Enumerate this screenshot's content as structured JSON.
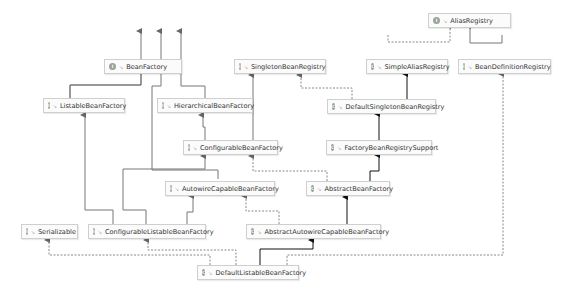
{
  "diagram": {
    "colors": {
      "background": "#ffffff",
      "node_border": "#cfcfcf",
      "node_fill": "#fbfbfb",
      "edge_extends": "#111111",
      "edge_interface_extends": "#777777",
      "edge_implements": "#888888",
      "interface_badge": "#9aa39a",
      "class_badge": "#8fa08f"
    },
    "legend": {
      "interface_badge_letter": "I",
      "class_badge_letter": "C",
      "visibility_glyph": "↘"
    },
    "nodes": [
      {
        "id": "AliasRegistry",
        "label": "AliasRegistry",
        "kind": "interface"
      },
      {
        "id": "BeanFactory",
        "label": "BeanFactory",
        "kind": "interface"
      },
      {
        "id": "SingletonBeanRegistry",
        "label": "SingletonBeanRegistry",
        "kind": "interface"
      },
      {
        "id": "SimpleAliasRegistry",
        "label": "SimpleAliasRegistry",
        "kind": "class"
      },
      {
        "id": "BeanDefinitionRegistry",
        "label": "BeanDefinitionRegistry",
        "kind": "interface"
      },
      {
        "id": "ListableBeanFactory",
        "label": "ListableBeanFactory",
        "kind": "interface"
      },
      {
        "id": "HierarchicalBeanFactory",
        "label": "HierarchicalBeanFactory",
        "kind": "interface"
      },
      {
        "id": "DefaultSingletonBeanRegistry",
        "label": "DefaultSingletonBeanRegistry",
        "kind": "class"
      },
      {
        "id": "ConfigurableBeanFactory",
        "label": "ConfigurableBeanFactory",
        "kind": "interface"
      },
      {
        "id": "FactoryBeanRegistrySupport",
        "label": "FactoryBeanRegistrySupport",
        "kind": "class"
      },
      {
        "id": "AutowireCapableBeanFactory",
        "label": "AutowireCapableBeanFactory",
        "kind": "interface"
      },
      {
        "id": "AbstractBeanFactory",
        "label": "AbstractBeanFactory",
        "kind": "class"
      },
      {
        "id": "Serializable",
        "label": "Serializable",
        "kind": "interface"
      },
      {
        "id": "ConfigurableListableBeanFactory",
        "label": "ConfigurableListableBeanFactory",
        "kind": "interface"
      },
      {
        "id": "AbstractAutowireCapableBeanFactory",
        "label": "AbstractAutowireCapableBeanFactory",
        "kind": "class"
      },
      {
        "id": "DefaultListableBeanFactory",
        "label": "DefaultListableBeanFactory",
        "kind": "class"
      }
    ],
    "edges": [
      {
        "from": "SimpleAliasRegistry",
        "to": "AliasRegistry",
        "type": "implements"
      },
      {
        "from": "BeanDefinitionRegistry",
        "to": "AliasRegistry",
        "type": "interface-extends"
      },
      {
        "from": "ListableBeanFactory",
        "to": "BeanFactory",
        "type": "interface-extends"
      },
      {
        "from": "HierarchicalBeanFactory",
        "to": "BeanFactory",
        "type": "interface-extends"
      },
      {
        "from": "AutowireCapableBeanFactory",
        "to": "BeanFactory",
        "type": "interface-extends"
      },
      {
        "from": "DefaultSingletonBeanRegistry",
        "to": "SingletonBeanRegistry",
        "type": "implements"
      },
      {
        "from": "DefaultSingletonBeanRegistry",
        "to": "SimpleAliasRegistry",
        "type": "extends"
      },
      {
        "from": "ConfigurableBeanFactory",
        "to": "HierarchicalBeanFactory",
        "type": "interface-extends"
      },
      {
        "from": "ConfigurableBeanFactory",
        "to": "SingletonBeanRegistry",
        "type": "interface-extends"
      },
      {
        "from": "FactoryBeanRegistrySupport",
        "to": "DefaultSingletonBeanRegistry",
        "type": "extends"
      },
      {
        "from": "AbstractBeanFactory",
        "to": "ConfigurableBeanFactory",
        "type": "implements"
      },
      {
        "from": "AbstractBeanFactory",
        "to": "FactoryBeanRegistrySupport",
        "type": "extends"
      },
      {
        "from": "ConfigurableListableBeanFactory",
        "to": "ListableBeanFactory",
        "type": "interface-extends"
      },
      {
        "from": "ConfigurableListableBeanFactory",
        "to": "AutowireCapableBeanFactory",
        "type": "interface-extends"
      },
      {
        "from": "ConfigurableListableBeanFactory",
        "to": "ConfigurableBeanFactory",
        "type": "interface-extends"
      },
      {
        "from": "AbstractAutowireCapableBeanFactory",
        "to": "AutowireCapableBeanFactory",
        "type": "implements"
      },
      {
        "from": "AbstractAutowireCapableBeanFactory",
        "to": "AbstractBeanFactory",
        "type": "extends"
      },
      {
        "from": "DefaultListableBeanFactory",
        "to": "Serializable",
        "type": "implements"
      },
      {
        "from": "DefaultListableBeanFactory",
        "to": "ConfigurableListableBeanFactory",
        "type": "implements"
      },
      {
        "from": "DefaultListableBeanFactory",
        "to": "AbstractAutowireCapableBeanFactory",
        "type": "extends"
      },
      {
        "from": "DefaultListableBeanFactory",
        "to": "BeanDefinitionRegistry",
        "type": "implements"
      }
    ]
  }
}
